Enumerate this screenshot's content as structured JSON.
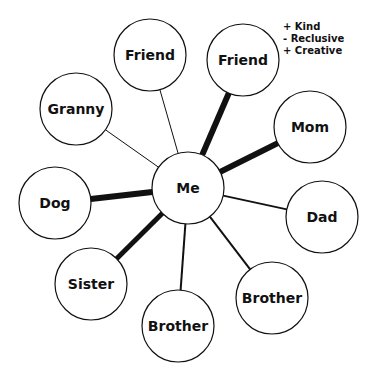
{
  "diagram": {
    "center": {
      "id": "me",
      "label": "Me",
      "x": 188,
      "y": 188,
      "r": 36
    },
    "nodes": [
      {
        "id": "friend-1",
        "label": "Friend",
        "x": 150,
        "y": 55,
        "r": 36,
        "weight": 1
      },
      {
        "id": "friend-2",
        "label": "Friend",
        "x": 243,
        "y": 60,
        "r": 36,
        "weight": 6
      },
      {
        "id": "mom",
        "label": "Mom",
        "x": 310,
        "y": 127,
        "r": 36,
        "weight": 6
      },
      {
        "id": "dad",
        "label": "Dad",
        "x": 322,
        "y": 217,
        "r": 36,
        "weight": 2
      },
      {
        "id": "brother-1",
        "label": "Brother",
        "x": 272,
        "y": 298,
        "r": 36,
        "weight": 2
      },
      {
        "id": "brother-2",
        "label": "Brother",
        "x": 178,
        "y": 326,
        "r": 36,
        "weight": 2
      },
      {
        "id": "sister",
        "label": "Sister",
        "x": 91,
        "y": 284,
        "r": 36,
        "weight": 5
      },
      {
        "id": "dog",
        "label": "Dog",
        "x": 55,
        "y": 203,
        "r": 36,
        "weight": 6
      },
      {
        "id": "granny",
        "label": "Granny",
        "x": 76,
        "y": 109,
        "r": 36,
        "weight": 1
      }
    ],
    "annotation": {
      "attached_to": "friend-2",
      "x": 283,
      "y": 30,
      "lines": [
        "+  Kind",
        "-  Reclusive",
        "+  Creative"
      ]
    },
    "colors": {
      "stroke": "#111111",
      "fill": "#ffffff"
    }
  }
}
